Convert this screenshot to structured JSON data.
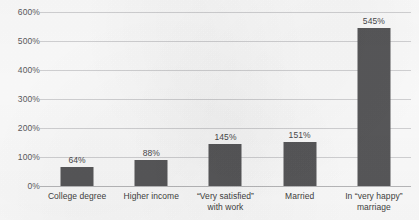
{
  "chart_data": {
    "type": "bar",
    "title": "",
    "xlabel": "",
    "ylabel": "",
    "ylim": [
      0,
      600
    ],
    "ytick_step": 100,
    "grid": true,
    "legend": false,
    "categories": [
      "College degree",
      "Higher income",
      "“Very satisfied”\nwith work",
      "Married",
      "In “very happy”\nmarriage"
    ],
    "values": [
      64,
      88,
      145,
      151,
      545
    ],
    "value_labels": [
      "64%",
      "88%",
      "145%",
      "151%",
      "545%"
    ],
    "ytick_labels": [
      "0%",
      "100%",
      "200%",
      "300%",
      "400%",
      "500%",
      "600%"
    ],
    "ytick_values": [
      0,
      100,
      200,
      300,
      400,
      500,
      600
    ],
    "colors": {
      "bar": "#58585a",
      "gridline": "#d3d3d5",
      "baseline": "#b9b9bb",
      "tick_text": "#5b5b5d",
      "label_text": "#3f3f41",
      "value_text": "#4a4a4c",
      "background": "#fdfdfd"
    }
  }
}
